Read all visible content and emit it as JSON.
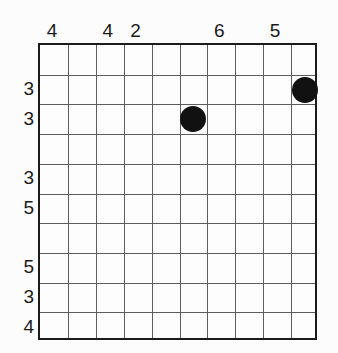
{
  "grid": {
    "columns": 10,
    "rows": 10,
    "border_color": "#1c1c1c",
    "line_color": "#5d5d5d",
    "background_color": "#fdfdfd"
  },
  "column_labels": [
    {
      "column": 1,
      "text": "4"
    },
    {
      "column": 3,
      "text": "4"
    },
    {
      "column": 4,
      "text": "2"
    },
    {
      "column": 7,
      "text": "6"
    },
    {
      "column": 9,
      "text": "5"
    }
  ],
  "row_labels": [
    {
      "row": 2,
      "text": "3"
    },
    {
      "row": 3,
      "text": "3"
    },
    {
      "row": 5,
      "text": "3"
    },
    {
      "row": 6,
      "text": "5"
    },
    {
      "row": 8,
      "text": "5"
    },
    {
      "row": 9,
      "text": "3"
    },
    {
      "row": 10,
      "text": "4"
    }
  ],
  "dots": [
    {
      "id": "dot-1",
      "column": 6,
      "row": 3,
      "diameter": 26,
      "color": "#111111"
    },
    {
      "id": "dot-2",
      "column": 10,
      "row": 2,
      "diameter": 26,
      "color": "#111111"
    }
  ],
  "chart_data": {
    "type": "scatter",
    "title": "",
    "xlabel": "",
    "ylabel": "",
    "grid": true,
    "legend": "none",
    "x_tick_labels": [
      "4",
      "",
      "4",
      "2",
      "",
      "",
      "6",
      "",
      "5",
      ""
    ],
    "y_tick_labels": [
      "",
      "3",
      "3",
      "",
      "3",
      "5",
      "",
      "5",
      "3",
      "4"
    ],
    "xlim": [
      0,
      10
    ],
    "ylim": [
      0,
      10
    ],
    "points": [
      {
        "x": 6,
        "y": 3
      },
      {
        "x": 10,
        "y": 2
      }
    ]
  }
}
